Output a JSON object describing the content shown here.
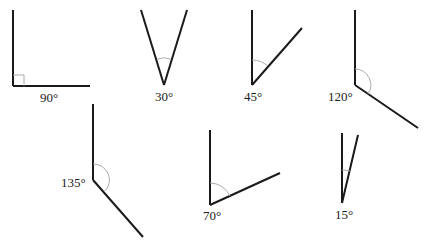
{
  "diagram": {
    "title": "",
    "angles": [
      {
        "id": "angle-90",
        "label": "90°",
        "degrees": 90,
        "marker": "right-angle-square"
      },
      {
        "id": "angle-30",
        "label": "30°",
        "degrees": 30,
        "marker": "arc"
      },
      {
        "id": "angle-45",
        "label": "45°",
        "degrees": 45,
        "marker": "arc"
      },
      {
        "id": "angle-120",
        "label": "120°",
        "degrees": 120,
        "marker": "arc"
      },
      {
        "id": "angle-135",
        "label": "135°",
        "degrees": 135,
        "marker": "arc"
      },
      {
        "id": "angle-70",
        "label": "70°",
        "degrees": 70,
        "marker": "arc"
      },
      {
        "id": "angle-15",
        "label": "15°",
        "degrees": 15,
        "marker": "arc"
      }
    ]
  },
  "colors": {
    "ray": "#1a1a1a",
    "arc": "#a0a0a0",
    "background": "#ffffff"
  }
}
